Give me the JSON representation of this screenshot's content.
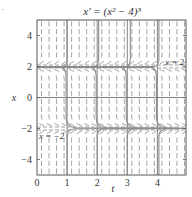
{
  "chart_data": {
    "type": "line",
    "subtype": "direction-field",
    "title": "x′ = (x² − 4)³",
    "xlabel": "t",
    "ylabel": "x",
    "xlim": [
      0,
      4.95
    ],
    "ylim": [
      -5,
      5
    ],
    "xticks": [
      0,
      1,
      2,
      3,
      4
    ],
    "xtick_labels": [
      "0",
      "1",
      "2",
      "3",
      "4"
    ],
    "yticks": [
      4,
      2,
      0,
      -2,
      -4
    ],
    "ytick_labels": [
      "4",
      "2",
      "0",
      "−2",
      "−4"
    ],
    "grid": true,
    "gridlines_x": [
      1,
      2,
      3,
      4
    ],
    "gridlines_y": [
      0
    ],
    "equilibria": [
      {
        "x": 2,
        "label": "x = 2",
        "style": "dashed"
      },
      {
        "x": -2,
        "label": "x = −2",
        "style": "dashed"
      }
    ],
    "direction_field": {
      "t_step": 0.25,
      "x_step": 0.5
    },
    "solution_curves": [
      {
        "region": "above 2",
        "blowup_t": [
          1.0,
          2.05,
          3.1,
          4.05
        ]
      },
      {
        "region": "between -2 and 2",
        "transition_t": [
          1.0,
          2.0,
          3.0,
          4.0
        ]
      },
      {
        "region": "below -2",
        "start_t": [
          1.0,
          2.0,
          3.0,
          4.05
        ]
      }
    ],
    "colors": {
      "frame": "#555555",
      "field": "#9a9a9a",
      "curve": "#8c8c8c",
      "axis": "#666666"
    }
  },
  "figure": {
    "title": "x′ = (x² − 4)³",
    "xlabel": "t",
    "ylabel": "x",
    "label_eq_top": "x = 2",
    "label_eq_bottom": "x = −2",
    "corner_mark": "."
  }
}
